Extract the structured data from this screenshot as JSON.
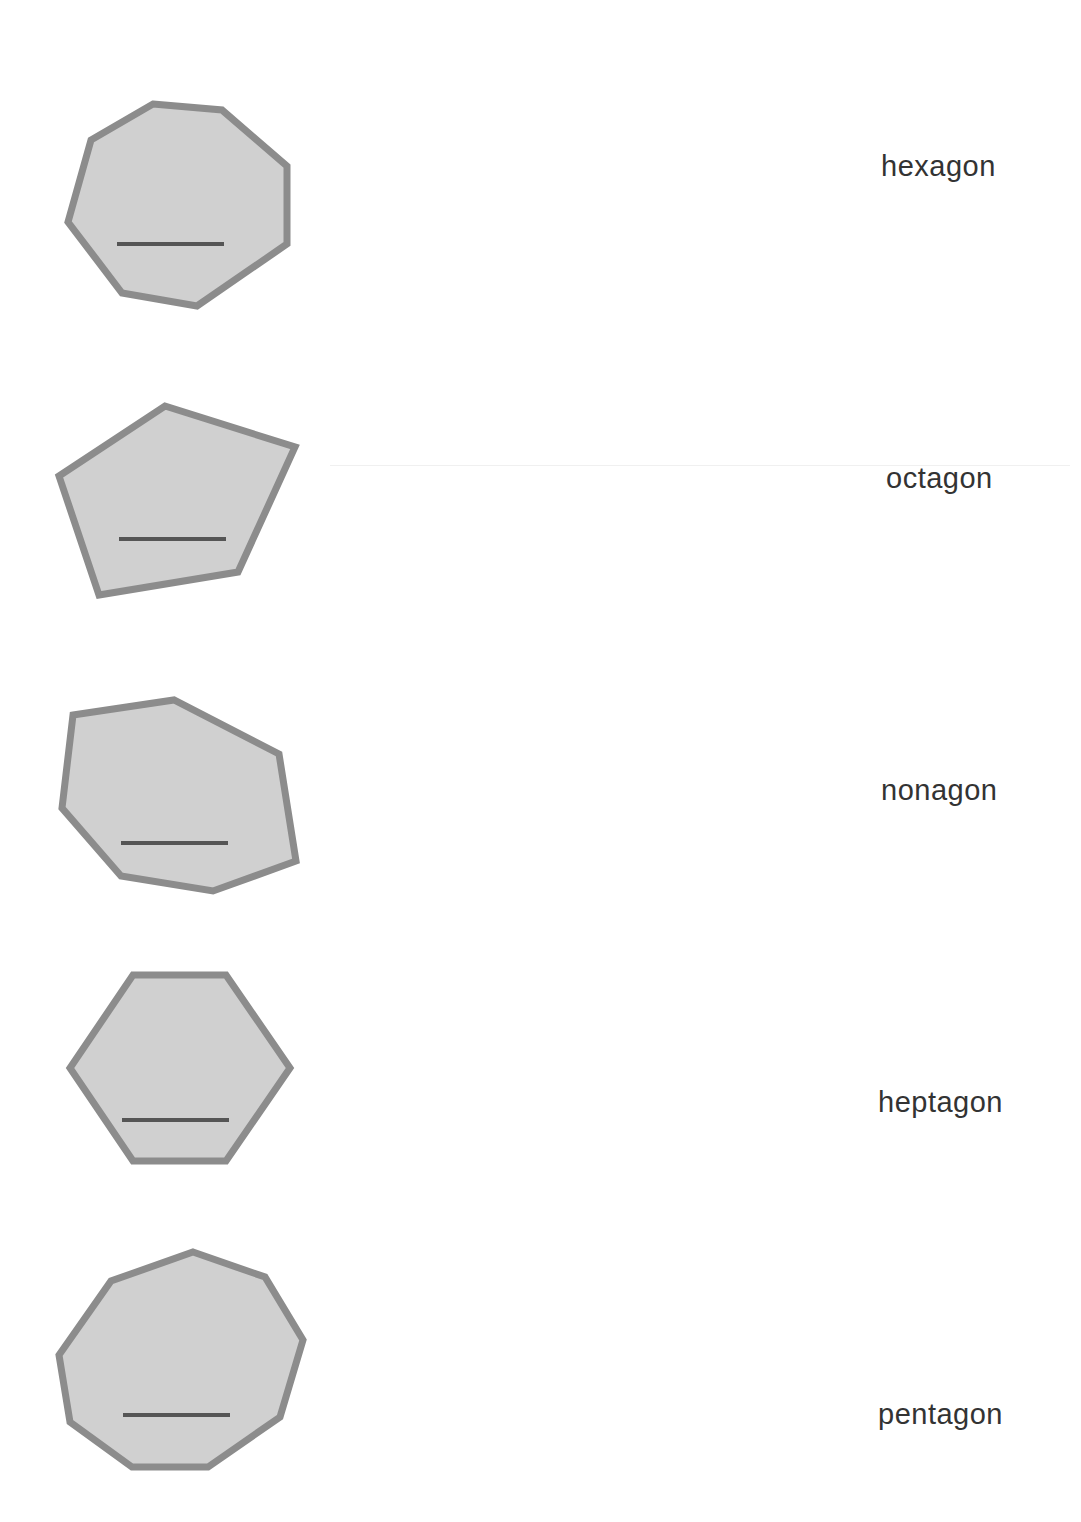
{
  "worksheet": {
    "colors": {
      "shape_fill": "#d0d0d0",
      "shape_stroke": "#8c8c8c",
      "answer_line": "#555555",
      "label_text": "#333333"
    },
    "rows": [
      {
        "shape": "heptagon-shape",
        "sides": 7,
        "points": "153,104 222,110 287,166 287,244 197,306 122,293 68,222 91,140",
        "line": {
          "x1": 117,
          "y1": 244,
          "x2": 224,
          "y2": 244
        },
        "label": "hexagon",
        "label_pos": {
          "x": 881,
          "y": 150
        }
      },
      {
        "shape": "pentagon-shape",
        "sides": 5,
        "points": "165,406 295,447 238,572 99,595 59,476",
        "line": {
          "x1": 119,
          "y1": 539,
          "x2": 226,
          "y2": 539
        },
        "label": "octagon",
        "label_pos": {
          "x": 886,
          "y": 462
        }
      },
      {
        "shape": "heptagon-shape-irregular",
        "sides": 7,
        "points": "73,715 174,700 279,754 296,861 213,891 121,876 62,808",
        "line": {
          "x1": 121,
          "y1": 843,
          "x2": 228,
          "y2": 843
        },
        "label": "nonagon",
        "label_pos": {
          "x": 881,
          "y": 774
        }
      },
      {
        "shape": "hexagon-shape",
        "sides": 6,
        "points": "133,975 226,975 290,1068 226,1161 133,1161 70,1068",
        "line": {
          "x1": 122,
          "y1": 1120,
          "x2": 229,
          "y2": 1120
        },
        "label": "heptagon",
        "label_pos": {
          "x": 878,
          "y": 1086
        }
      },
      {
        "shape": "nonagon-shape",
        "sides": 9,
        "points": "193,1252 265,1277 303,1340 280,1417 208,1467 132,1467 70,1422 59,1355 111,1281",
        "line": {
          "x1": 123,
          "y1": 1415,
          "x2": 230,
          "y2": 1415
        },
        "label": "pentagon",
        "label_pos": {
          "x": 878,
          "y": 1398
        }
      }
    ]
  }
}
